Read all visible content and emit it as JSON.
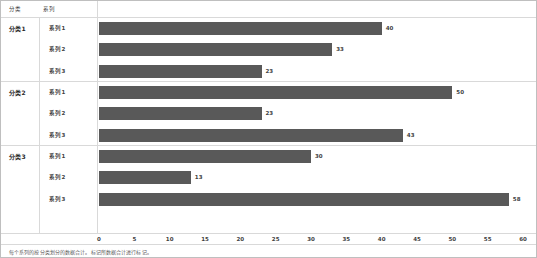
{
  "table": {
    "header": {
      "category_label": "分类",
      "series_label": "系列"
    }
  },
  "footnote": {
    "text": "每个系列的按分类划分的数据合计。标记所数据合计进行标记。"
  },
  "chart_data": {
    "type": "bar",
    "orientation": "horizontal",
    "title": "",
    "xlabel": "",
    "ylabel": "",
    "xlim": [
      0,
      60
    ],
    "xticks": [
      "0",
      "5",
      "10",
      "15",
      "20",
      "25",
      "30",
      "35",
      "40",
      "45",
      "50",
      "55",
      "60"
    ],
    "grid": false,
    "legend": "none",
    "bar_color": "#595959",
    "categories": [
      "分类1",
      "分类2",
      "分类3"
    ],
    "series_names": [
      "系列1",
      "系列2",
      "系列3"
    ],
    "groups": [
      {
        "category": "分类1",
        "rows": [
          {
            "series": "系列1",
            "value": 40,
            "label": "40"
          },
          {
            "series": "系列2",
            "value": 33,
            "label": "33"
          },
          {
            "series": "系列3",
            "value": 23,
            "label": "23"
          }
        ]
      },
      {
        "category": "分类2",
        "rows": [
          {
            "series": "系列1",
            "value": 50,
            "label": "50"
          },
          {
            "series": "系列2",
            "value": 23,
            "label": "23"
          },
          {
            "series": "系列3",
            "value": 43,
            "label": "43"
          }
        ]
      },
      {
        "category": "分类3",
        "rows": [
          {
            "series": "系列1",
            "value": 30,
            "label": "30"
          },
          {
            "series": "系列2",
            "value": 13,
            "label": "13"
          },
          {
            "series": "系列3",
            "value": 58,
            "label": "58"
          }
        ]
      }
    ]
  }
}
